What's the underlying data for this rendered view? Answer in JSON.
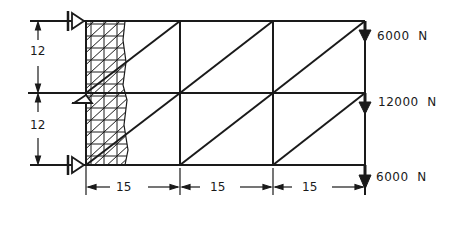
{
  "diagram": {
    "type": "truss-with-wall-support",
    "colors": {
      "ink": "#1a1a1a",
      "background": "#ffffff"
    },
    "dimensions": {
      "vertical": [
        {
          "label": "12"
        },
        {
          "label": "12"
        }
      ],
      "horizontal": [
        {
          "label": "15"
        },
        {
          "label": "15"
        },
        {
          "label": "15"
        }
      ]
    },
    "loads": [
      {
        "value": "6000",
        "unit": "N",
        "node": "top-right"
      },
      {
        "value": "12000",
        "unit": "N",
        "node": "middle-right"
      },
      {
        "value": "6000",
        "unit": "N",
        "node": "bottom-right"
      }
    ],
    "supports": [
      {
        "type": "roller",
        "node": "top-left"
      },
      {
        "type": "roller",
        "node": "middle-left"
      },
      {
        "type": "roller",
        "node": "bottom-left"
      }
    ]
  }
}
